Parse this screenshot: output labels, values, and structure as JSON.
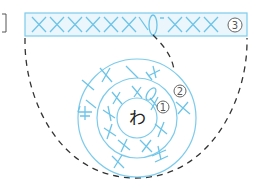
{
  "diagram": {
    "type": "crochet-chart",
    "center_label": "わ",
    "round_labels": [
      {
        "number": "1",
        "glyph": "①"
      },
      {
        "number": "2",
        "glyph": "②"
      },
      {
        "number": "3",
        "glyph": "③"
      }
    ],
    "top_row": {
      "stitch_symbol": "×",
      "stitches_before_chain": 7,
      "stitches_after_chain": 3
    },
    "colors": {
      "stitch": "#6cc4e8",
      "dashed_outline": "#333333",
      "label_circle": "#666666"
    }
  }
}
